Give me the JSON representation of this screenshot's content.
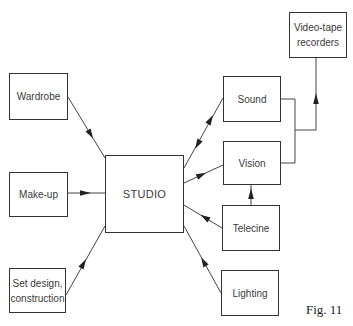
{
  "diagram": {
    "nodes": {
      "wardrobe": {
        "label": "Wardrobe"
      },
      "makeup": {
        "label": "Make-up"
      },
      "set_design": {
        "line1": "Set design,",
        "line2": "construction"
      },
      "studio": {
        "label": "STUDIO"
      },
      "sound": {
        "label": "Sound"
      },
      "vision": {
        "label": "Vision"
      },
      "telecine": {
        "label": "Telecine"
      },
      "lighting": {
        "label": "Lighting"
      },
      "vtr": {
        "line1": "Video-tape",
        "line2": "recorders"
      }
    },
    "edges": [
      {
        "from": "Wardrobe",
        "to": "STUDIO",
        "direction": "to"
      },
      {
        "from": "Make-up",
        "to": "STUDIO",
        "direction": "to"
      },
      {
        "from": "Set design, construction",
        "to": "STUDIO",
        "direction": "to"
      },
      {
        "from": "STUDIO",
        "to": "Sound",
        "direction": "both"
      },
      {
        "from": "STUDIO",
        "to": "Vision",
        "direction": "to"
      },
      {
        "from": "Telecine",
        "to": "STUDIO",
        "direction": "to"
      },
      {
        "from": "Lighting",
        "to": "STUDIO",
        "direction": "to"
      },
      {
        "from": "Telecine",
        "to": "Vision",
        "direction": "to"
      },
      {
        "from": "Sound + Vision",
        "to": "Video-tape recorders",
        "direction": "to"
      }
    ],
    "caption": "Fig. 11"
  }
}
